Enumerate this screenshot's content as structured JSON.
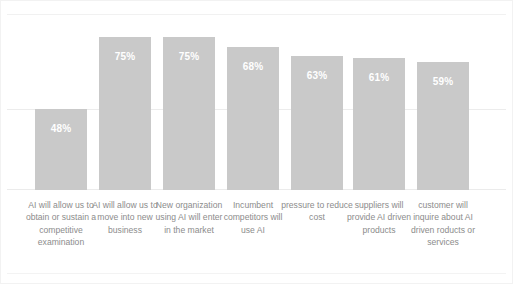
{
  "chart_data": {
    "type": "bar",
    "title": "",
    "subtitle": "",
    "xlabel": "",
    "ylabel": "",
    "ylim": [
      0,
      100
    ],
    "grid": true,
    "legend": "none",
    "orientation": "vertical",
    "bar_color": "#c9c9c9",
    "value_label_color": "#ffffff",
    "category_label_color": "#8c8c8c",
    "background_color": "#ffffff",
    "categories": [
      "AI will allow us to obtain or sustain a competitive examination",
      "AI will allow us to move into new business",
      "New organization using AI will enter in the market",
      "Incumbent competitors will use AI",
      "pressure to reduce cost",
      "suppliers will provide AI driven products",
      "customer will inquire about AI driven roducts or services"
    ],
    "values": [
      48,
      75,
      75,
      68,
      63,
      61,
      59
    ],
    "value_labels": [
      "48%",
      "75%",
      "75%",
      "68%",
      "63%",
      "61%",
      "59%"
    ]
  },
  "bars": [
    {
      "value_label": "48%",
      "height_px": 81,
      "left_px": 34
    },
    {
      "value_label": "75%",
      "height_px": 153,
      "left_px": 98
    },
    {
      "value_label": "75%",
      "height_px": 153,
      "left_px": 162
    },
    {
      "value_label": "68%",
      "height_px": 143,
      "left_px": 226
    },
    {
      "value_label": "63%",
      "height_px": 134,
      "left_px": 290
    },
    {
      "value_label": "61%",
      "height_px": 132,
      "left_px": 352
    },
    {
      "value_label": "59%",
      "height_px": 128,
      "left_px": 416
    }
  ],
  "category_labels": [
    {
      "text": "AI will allow us to obtain or sustain a competitive examination",
      "left_px": 24
    },
    {
      "text": "AI will allow us to move into new business",
      "left_px": 88
    },
    {
      "text": "New organization using AI will enter in the market",
      "left_px": 152
    },
    {
      "text": "Incumbent competitors will use AI",
      "left_px": 216
    },
    {
      "text": "pressure to reduce cost",
      "left_px": 280
    },
    {
      "text": "suppliers will provide AI driven products",
      "left_px": 342
    },
    {
      "text": "customer will inquire about AI driven roducts or services",
      "left_px": 406
    }
  ]
}
